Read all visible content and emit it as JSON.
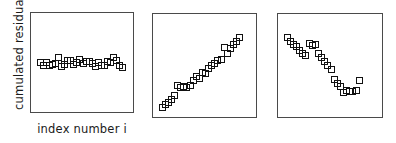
{
  "figure": {
    "width": 396,
    "height": 143,
    "background": "#ffffff",
    "frame_color": "#4a4a4a",
    "marker_color": "#111111"
  },
  "axis_labels": {
    "ylabel": "cumulated residuals",
    "xlabel": "index number i"
  },
  "chart_data": [
    {
      "type": "scatter",
      "title": "",
      "xlabel": "index number i",
      "ylabel": "cumulated residuals",
      "xlim": [
        0,
        30
      ],
      "ylim": [
        -1,
        1
      ],
      "grid": false,
      "legend": null,
      "marker": "open-square",
      "panel": {
        "x": 30,
        "y": 12,
        "width": 104,
        "height": 101
      },
      "points": [
        {
          "x": 1,
          "y": 0.02
        },
        {
          "x": 2,
          "y": -0.04
        },
        {
          "x": 3,
          "y": 0.03
        },
        {
          "x": 4,
          "y": -0.05
        },
        {
          "x": 5,
          "y": -0.02
        },
        {
          "x": 6,
          "y": 0.0
        },
        {
          "x": 7,
          "y": 0.13
        },
        {
          "x": 8,
          "y": -0.06
        },
        {
          "x": 9,
          "y": -0.02
        },
        {
          "x": 10,
          "y": 0.06
        },
        {
          "x": 11,
          "y": 0.07
        },
        {
          "x": 12,
          "y": -0.03
        },
        {
          "x": 13,
          "y": 0.02
        },
        {
          "x": 14,
          "y": 0.09
        },
        {
          "x": 15,
          "y": 0.0
        },
        {
          "x": 16,
          "y": 0.05
        },
        {
          "x": 17,
          "y": 0.04
        },
        {
          "x": 18,
          "y": -0.01
        },
        {
          "x": 19,
          "y": -0.07
        },
        {
          "x": 20,
          "y": 0.03
        },
        {
          "x": 21,
          "y": -0.04
        },
        {
          "x": 22,
          "y": -0.04
        },
        {
          "x": 23,
          "y": 0.04
        },
        {
          "x": 24,
          "y": 0.02
        },
        {
          "x": 25,
          "y": 0.13
        },
        {
          "x": 26,
          "y": 0.06
        },
        {
          "x": 27,
          "y": -0.05
        },
        {
          "x": 28,
          "y": -0.08
        }
      ]
    },
    {
      "type": "scatter",
      "title": "",
      "xlabel": "",
      "ylabel": "",
      "xlim": [
        0,
        30
      ],
      "ylim": [
        -1,
        1
      ],
      "grid": false,
      "legend": null,
      "marker": "open-square",
      "panel": {
        "x": 152,
        "y": 13,
        "width": 105,
        "height": 105
      },
      "points": [
        {
          "x": 1,
          "y": -0.86
        },
        {
          "x": 2,
          "y": -0.8
        },
        {
          "x": 3,
          "y": -0.76
        },
        {
          "x": 4,
          "y": -0.7
        },
        {
          "x": 5,
          "y": -0.62
        },
        {
          "x": 6,
          "y": -0.41
        },
        {
          "x": 7,
          "y": -0.45
        },
        {
          "x": 8,
          "y": -0.42
        },
        {
          "x": 9,
          "y": -0.44
        },
        {
          "x": 10,
          "y": -0.39
        },
        {
          "x": 11,
          "y": -0.3
        },
        {
          "x": 12,
          "y": -0.22
        },
        {
          "x": 13,
          "y": -0.26
        },
        {
          "x": 14,
          "y": -0.12
        },
        {
          "x": 15,
          "y": -0.14
        },
        {
          "x": 16,
          "y": -0.05
        },
        {
          "x": 17,
          "y": 0.03
        },
        {
          "x": 18,
          "y": 0.07
        },
        {
          "x": 19,
          "y": 0.12
        },
        {
          "x": 20,
          "y": 0.15
        },
        {
          "x": 21,
          "y": 0.39
        },
        {
          "x": 22,
          "y": 0.28
        },
        {
          "x": 23,
          "y": 0.38
        },
        {
          "x": 24,
          "y": 0.46
        },
        {
          "x": 25,
          "y": 0.52
        },
        {
          "x": 26,
          "y": 0.62
        }
      ]
    },
    {
      "type": "scatter",
      "title": "",
      "xlabel": "",
      "ylabel": "",
      "xlim": [
        0,
        30
      ],
      "ylim": [
        -1,
        1
      ],
      "grid": false,
      "legend": null,
      "marker": "open-square",
      "panel": {
        "x": 277,
        "y": 13,
        "width": 106,
        "height": 105
      },
      "points": [
        {
          "x": 1,
          "y": 0.62
        },
        {
          "x": 2,
          "y": 0.52
        },
        {
          "x": 3,
          "y": 0.47
        },
        {
          "x": 4,
          "y": 0.43
        },
        {
          "x": 5,
          "y": 0.33
        },
        {
          "x": 6,
          "y": 0.28
        },
        {
          "x": 7,
          "y": 0.24
        },
        {
          "x": 8,
          "y": 0.49
        },
        {
          "x": 9,
          "y": 0.44
        },
        {
          "x": 10,
          "y": 0.46
        },
        {
          "x": 11,
          "y": 0.27
        },
        {
          "x": 12,
          "y": 0.2
        },
        {
          "x": 13,
          "y": 0.11
        },
        {
          "x": 14,
          "y": 0.02
        },
        {
          "x": 15,
          "y": -0.06
        },
        {
          "x": 16,
          "y": -0.28
        },
        {
          "x": 17,
          "y": -0.35
        },
        {
          "x": 18,
          "y": -0.42
        },
        {
          "x": 19,
          "y": -0.55
        },
        {
          "x": 20,
          "y": -0.5
        },
        {
          "x": 21,
          "y": -0.52
        },
        {
          "x": 22,
          "y": -0.53
        },
        {
          "x": 23,
          "y": -0.5
        },
        {
          "x": 24,
          "y": -0.3
        }
      ]
    }
  ]
}
